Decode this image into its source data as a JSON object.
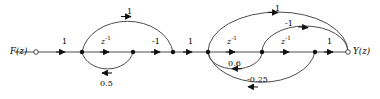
{
  "figure": {
    "kind": "signal-flow-graph",
    "colors": {
      "line": "#4d4d4d",
      "arrow": "#111111",
      "node": "#111111",
      "text": "#000000",
      "background": "#ffffff"
    },
    "input": {
      "label": "F(z)",
      "terminal": "open-circle",
      "x": 10,
      "y": 52
    },
    "output": {
      "label": "Y(z)",
      "terminal": "open-circle",
      "x": 353,
      "y": 52
    },
    "nodes": [
      {
        "id": "n1",
        "x": 82,
        "y": 52
      },
      {
        "id": "n2",
        "x": 133,
        "y": 52
      },
      {
        "id": "n3",
        "x": 173,
        "y": 52
      },
      {
        "id": "n4",
        "x": 208,
        "y": 52
      },
      {
        "id": "n5",
        "x": 262,
        "y": 52
      },
      {
        "id": "n6",
        "x": 315,
        "y": 52
      }
    ],
    "forward_branches": [
      {
        "id": "b1",
        "gain": "1",
        "italic": false,
        "x": 62,
        "y": 38
      },
      {
        "id": "b2",
        "gain": "z",
        "exp": "-1",
        "italic": true,
        "x": 101,
        "y": 38
      },
      {
        "id": "b3",
        "gain": "-1",
        "italic": false,
        "x": 152,
        "y": 38
      },
      {
        "id": "b4",
        "gain": "1",
        "italic": false,
        "x": 188,
        "y": 38
      },
      {
        "id": "b5",
        "gain": "z",
        "exp": "-1",
        "italic": true,
        "x": 227,
        "y": 38
      },
      {
        "id": "b6",
        "gain": "z",
        "exp": "-1",
        "italic": true,
        "x": 281,
        "y": 38
      },
      {
        "id": "b7",
        "gain": "1",
        "italic": false,
        "x": 327,
        "y": 38
      }
    ],
    "feed_branches": [
      {
        "id": "f1",
        "gain": "1",
        "x": 127,
        "y": 8,
        "direction": "forward",
        "position": "above"
      },
      {
        "id": "f2",
        "gain": "0.5",
        "x": 100,
        "y": 80,
        "direction": "feedback",
        "position": "below"
      },
      {
        "id": "f3",
        "gain": "1",
        "x": 275,
        "y": 5,
        "direction": "forward",
        "position": "above"
      },
      {
        "id": "f4",
        "gain": "-1",
        "x": 285,
        "y": 20,
        "direction": "forward",
        "position": "above"
      },
      {
        "id": "f5",
        "gain": "0.6",
        "x": 228,
        "y": 60,
        "direction": "feedback",
        "position": "below"
      },
      {
        "id": "f6",
        "gain": "-0.25",
        "x": 247,
        "y": 76,
        "direction": "feedback",
        "position": "below"
      }
    ]
  }
}
